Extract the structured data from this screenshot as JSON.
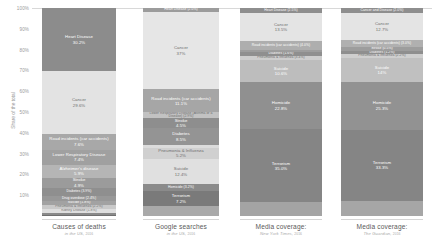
{
  "axis": {
    "title": "Share of the total",
    "ticks": [
      "100%",
      "90%",
      "80%",
      "70%",
      "60%",
      "50%",
      "40%",
      "30%",
      "20%",
      "10%"
    ],
    "tick_values": [
      100,
      90,
      80,
      70,
      60,
      50,
      40,
      30,
      20,
      10
    ]
  },
  "columns": [
    {
      "key": "deaths",
      "caption": "Causes of deaths",
      "sub_source": "in the US,",
      "sub_year": "2016"
    },
    {
      "key": "google",
      "caption": "Google searches",
      "sub_source": "in the US,",
      "sub_year": "2016"
    },
    {
      "key": "nyt",
      "caption": "Media coverage:",
      "sub_source": "New York Times,",
      "sub_year": "2016"
    },
    {
      "key": "guardian",
      "caption": "Media coverage:",
      "sub_source": "The Guardian,",
      "sub_year": "2016"
    }
  ],
  "chart_data": {
    "type": "bar",
    "subtype": "stacked-100-percent",
    "title": "",
    "xlabel": "",
    "ylabel": "Share of the total",
    "ylim": [
      0,
      100
    ],
    "grid": false,
    "legend": "none",
    "categories": [
      "Causes of deaths",
      "Google searches",
      "Media coverage: New York Times",
      "Media coverage: The Guardian"
    ],
    "series": [
      {
        "name": "Causes of deaths",
        "column": "deaths",
        "segments": [
          {
            "label": "Heart Disease",
            "value_text": "30.2%",
            "value": 30.2,
            "color": "#8c8c8c",
            "text": "light"
          },
          {
            "label": "Cancer",
            "value_text": "29.6%",
            "value": 29.6,
            "color": "#e3e3e3",
            "text": "dark"
          },
          {
            "label": "Road incidents (car accidents)",
            "value_text": "7.6%",
            "value": 7.6,
            "color": "#a8a8a8",
            "text": "light"
          },
          {
            "label": "Lower Respiratory Disease",
            "value_text": "7.4%",
            "value": 7.4,
            "color": "#a0a0a0",
            "text": "light"
          },
          {
            "label": "Alzheimer's disease",
            "value_text": "5.9%",
            "value": 5.9,
            "color": "#b5b5b5",
            "text": "light"
          },
          {
            "label": "Stroke",
            "value_text": "4.9%",
            "value": 4.9,
            "color": "#9b9b9b",
            "text": "light"
          },
          {
            "label": "Diabetes",
            "value_text": "3.9%",
            "value": 3.9,
            "color": "#8f8f8f",
            "text": "light"
          },
          {
            "label": "Drug overdose",
            "value_text": "2.4%",
            "value": 2.4,
            "color": "#989898",
            "text": "light"
          },
          {
            "label": "Suicide",
            "value_text": "1.8%",
            "value": 1.8,
            "color": "#a2a2a2",
            "text": "light"
          },
          {
            "label": "Pneumonia & Influenza",
            "value_text": "2.2%",
            "value": 2.2,
            "color": "#c9c9c9",
            "text": "dark"
          },
          {
            "label": "Kidney Disease",
            "value_text": "1.8%",
            "value": 1.8,
            "color": "#dedede",
            "text": "dark"
          },
          {
            "label": "Homicide",
            "value_text": "0.9%",
            "value": 0.9,
            "color": "#8a8a8a",
            "text": "light"
          },
          {
            "label": "Terrorism",
            "value_text": "0.01%",
            "value": 0.4,
            "color": "#6f6f6f",
            "text": "light"
          }
        ]
      },
      {
        "name": "Google searches",
        "column": "google",
        "segments": [
          {
            "label": "Heart Disease",
            "value_text": "2.0%",
            "value": 2.0,
            "color": "#9c9c9c",
            "text": "light"
          },
          {
            "label": "Cancer",
            "value_text": "37%",
            "value": 37.0,
            "color": "#e6e6e6",
            "text": "dark"
          },
          {
            "label": "Road incidents (car accidents)",
            "value_text": "11.1%",
            "value": 11.1,
            "color": "#a6a6a6",
            "text": "light"
          },
          {
            "label": "Lower Respiratory Disease (Asthma or a Disease)",
            "value_text": "2.9%",
            "value": 2.9,
            "color": "#c2c2c2",
            "text": "dark"
          },
          {
            "label": "Stroke",
            "value_text": "4.5%",
            "value": 4.5,
            "color": "#8e8e8e",
            "text": "light"
          },
          {
            "label": "Diabetes",
            "value_text": "8.5%",
            "value": 8.5,
            "color": "#949494",
            "text": "light"
          },
          {
            "label": "Kidney Disease",
            "value_text": "1.2%",
            "value": 1.2,
            "color": "#dcdcdc",
            "text": "dark"
          },
          {
            "label": "Pneumonia & Influenza",
            "value_text": "5.2%",
            "value": 5.2,
            "color": "#d0d0d0",
            "text": "dark"
          },
          {
            "label": "Suicide",
            "value_text": "12.4%",
            "value": 12.4,
            "color": "#e0e0e0",
            "text": "dark"
          },
          {
            "label": "Homicide",
            "value_text": "3.2%",
            "value": 3.2,
            "color": "#8b8b8b",
            "text": "light"
          },
          {
            "label": "Terrorism",
            "value_text": "7.2%",
            "value": 7.2,
            "color": "#7a7a7a",
            "text": "light"
          },
          {
            "label": "",
            "value_text": "",
            "value": 4.7,
            "color": "#a9a9a9",
            "text": "light"
          }
        ]
      },
      {
        "name": "Media coverage: New York Times",
        "column": "nyt",
        "segments": [
          {
            "label": "Heart Disease",
            "value_text": "2.5%",
            "value": 2.5,
            "color": "#8e8e8e",
            "text": "light"
          },
          {
            "label": "Cancer",
            "value_text": "13.5%",
            "value": 13.5,
            "color": "#e4e4e4",
            "text": "dark"
          },
          {
            "label": "Road incidents (car accidents)",
            "value_text": "4.0%",
            "value": 4.0,
            "color": "#aeaeae",
            "text": "light"
          },
          {
            "label": "Stroke",
            "value_text": "0.6%",
            "value": 1.0,
            "color": "#9d9d9d",
            "text": "light"
          },
          {
            "label": "Diabetes",
            "value_text": "1.6%",
            "value": 2.0,
            "color": "#8f8f8f",
            "text": "light"
          },
          {
            "label": "Pneumonia & Influenza",
            "value_text": "3.4%",
            "value": 2.0,
            "color": "#cdcdcd",
            "text": "dark"
          },
          {
            "label": "Suicide",
            "value_text": "10.6%",
            "value": 10.6,
            "color": "#bdbdbd",
            "text": "light"
          },
          {
            "label": "Homicide",
            "value_text": "22.8%",
            "value": 22.8,
            "color": "#909090",
            "text": "light"
          },
          {
            "label": "Terrorism",
            "value_text": "35.0%",
            "value": 35.0,
            "color": "#858585",
            "text": "light"
          },
          {
            "label": "",
            "value_text": "",
            "value": 6.6,
            "color": "#a4a4a4",
            "text": "light"
          }
        ]
      },
      {
        "name": "Media coverage: The Guardian",
        "column": "guardian",
        "segments": [
          {
            "label": "Cancer and Disease",
            "value_text": "2.0%",
            "value": 2.5,
            "color": "#8e8e8e",
            "text": "light"
          },
          {
            "label": "Cancer",
            "value_text": "12.7%",
            "value": 13.0,
            "color": "#e4e4e4",
            "text": "dark"
          },
          {
            "label": "Road incidents (car accidents)",
            "value_text": "3.0%",
            "value": 3.4,
            "color": "#b0b0b0",
            "text": "light"
          },
          {
            "label": "Stroke",
            "value_text": "0.5%",
            "value": 1.6,
            "color": "#9d9d9d",
            "text": "light"
          },
          {
            "label": "Diabetes",
            "value_text": "1.2%",
            "value": 1.8,
            "color": "#8f8f8f",
            "text": "light"
          },
          {
            "label": "Pneumonia & Influenza",
            "value_text": "2.2%",
            "value": 1.9,
            "color": "#cfcfcf",
            "text": "dark"
          },
          {
            "label": "Suicide",
            "value_text": "14%",
            "value": 11.3,
            "color": "#c0c0c0",
            "text": "light"
          },
          {
            "label": "Homicide",
            "value_text": "25.3%",
            "value": 23.0,
            "color": "#929292",
            "text": "light"
          },
          {
            "label": "Terrorism",
            "value_text": "33.3%",
            "value": 34.5,
            "color": "#858585",
            "text": "light"
          },
          {
            "label": "",
            "value_text": "",
            "value": 7.0,
            "color": "#a6a6a6",
            "text": "light"
          }
        ]
      }
    ]
  }
}
